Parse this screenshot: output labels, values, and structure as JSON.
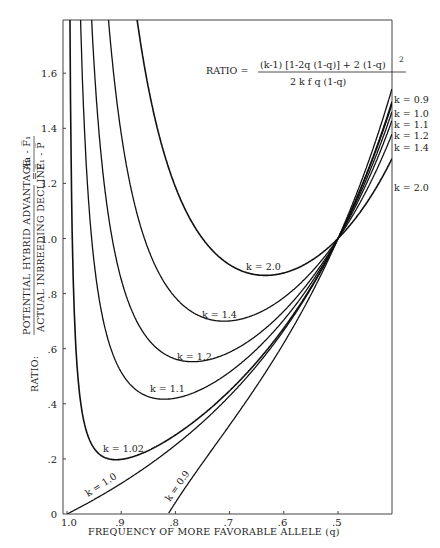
{
  "chart_data": {
    "type": "line",
    "title": "",
    "formula": {
      "lhs": "RATIO = ",
      "numerator": "(k-1) [1-2q (1-q)] + 2 (1-q)",
      "numerator_exponent": "2",
      "denominator": "2 k f q (1-q)"
    },
    "xlabel": "FREQUENCY OF MORE FAVORABLE ALLELE  (q)",
    "ylabel": {
      "prefix": "RATIO:",
      "numerator": "POTENTIAL HYBRID ADVANTAGE",
      "denominator": "ACTUAL INBREEDING DECLINE",
      "equals": "=",
      "alt_numerator": "Aa - F̅₁",
      "alt_denominator": "F̅₁ - P̅"
    },
    "x_ticks": [
      {
        "value": 1.0,
        "label": "1.0"
      },
      {
        "value": 0.9,
        "label": ".9"
      },
      {
        "value": 0.8,
        "label": ".8"
      },
      {
        "value": 0.7,
        "label": ".7"
      },
      {
        "value": 0.6,
        "label": ".6"
      },
      {
        "value": 0.5,
        "label": ".5"
      }
    ],
    "y_ticks": [
      {
        "value": 0,
        "label": "0"
      },
      {
        "value": 0.2,
        "label": ".2"
      },
      {
        "value": 0.4,
        "label": ".4"
      },
      {
        "value": 0.6,
        "label": ".6"
      },
      {
        "value": 0.8,
        "label": ".8"
      },
      {
        "value": 1.0,
        "label": "1.0"
      },
      {
        "value": 1.2,
        "label": "1.2"
      },
      {
        "value": 1.4,
        "label": "1.4"
      },
      {
        "value": 1.6,
        "label": "1.6"
      }
    ],
    "xlim": [
      1.0,
      0.4
    ],
    "ylim": [
      0,
      1.79
    ],
    "x_reversed": true,
    "grid": false,
    "series": [
      {
        "name": "k = 0.9",
        "k": 0.9,
        "label": "k = 0.9",
        "label_pos": "inline-bottom",
        "end_label": "k = 0.9"
      },
      {
        "name": "k = 1.0",
        "k": 1.0,
        "label": "k = 1.0",
        "label_pos": "inline-bottom",
        "end_label": "k = 1.0"
      },
      {
        "name": "k = 1.02",
        "k": 1.02,
        "label": "k = 1.02",
        "label_pos": "minimum"
      },
      {
        "name": "k = 1.1",
        "k": 1.1,
        "label": "k = 1.1",
        "label_pos": "minimum",
        "end_label": "k = 1.1"
      },
      {
        "name": "k = 1.2",
        "k": 1.2,
        "label": "k = 1.2",
        "label_pos": "minimum",
        "end_label": "k = 1.2"
      },
      {
        "name": "k = 1.4",
        "k": 1.4,
        "label": "k = 1.4",
        "label_pos": "minimum",
        "end_label": "k = 1.4"
      },
      {
        "name": "k = 2.0",
        "k": 2.0,
        "label": "k = 2.0",
        "label_pos": "minimum",
        "end_label": "k = 2.0"
      }
    ],
    "sample_points": {
      "note": "values computed from the plotted formula with f = 1",
      "q": [
        0.95,
        0.9,
        0.8,
        0.7,
        0.6,
        0.5,
        0.45
      ],
      "k_0.9": [
        null,
        null,
        0.04,
        0.3,
        0.61,
        1.0,
        1.26
      ],
      "k_1.0": [
        0.05,
        0.11,
        0.25,
        0.43,
        0.67,
        1.0,
        1.22
      ],
      "k_1.02": [
        0.25,
        0.2,
        0.28,
        0.45,
        0.68,
        1.0,
        1.21
      ],
      "k_1.1": [
        0.96,
        0.57,
        0.42,
        0.52,
        0.71,
        1.0,
        1.19
      ],
      "k_1.2": [
        1.76,
        1.0,
        0.61,
        0.61,
        0.75,
        1.0,
        1.17
      ],
      "k_1.4": [
        3.11,
        1.73,
        0.92,
        0.76,
        0.81,
        1.0,
        1.14
      ],
      "k_2.0": [
        5.74,
        3.16,
        1.53,
        1.04,
        0.875,
        1.0,
        1.1
      ]
    }
  }
}
